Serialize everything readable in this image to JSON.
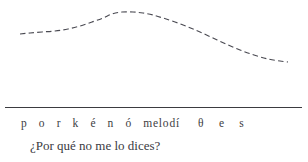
{
  "figure": {
    "name": "intonation-contour-figure",
    "background_color": "#ffffff",
    "ink_color": "#3d3d42",
    "contour_color": "#4a4a52"
  },
  "transcription": {
    "full": "p o r k é n ó  m e l o d í   θ   e   s",
    "segments": [
      {
        "text": "p o r k é n ó ",
        "style": "wide"
      },
      {
        "text": "melodí",
        "style": "tight"
      },
      {
        "text": "  θ e s",
        "style": "gap"
      }
    ],
    "phones": [
      "p",
      "o",
      "r",
      "k",
      "é",
      "n",
      "ó",
      "m",
      "e",
      "l",
      "o",
      "d",
      "í",
      "θ",
      "e",
      "s"
    ]
  },
  "gloss": {
    "text": "¿Por qué no me lo dices?",
    "language": "Spanish"
  },
  "baseline": {
    "label": "baseline-rule",
    "x_start": 5,
    "x_end": 302,
    "y": 107
  },
  "chart_data": {
    "type": "line",
    "title": "",
    "subtitle": "",
    "xlabel": "",
    "ylabel": "",
    "grid": false,
    "legend": null,
    "series": [
      {
        "name": "pitch-contour",
        "style": "dashed",
        "color": "#4a4a52",
        "x": [
          20,
          30,
          42,
          55,
          68,
          80,
          92,
          103,
          112,
          122,
          133,
          143,
          153,
          163,
          175,
          188,
          200,
          213,
          226,
          240,
          254,
          268,
          280,
          288
        ],
        "y": [
          34,
          33,
          32,
          31,
          29,
          26,
          22,
          18,
          14,
          12,
          12,
          13,
          15,
          18,
          22,
          27,
          32,
          38,
          44,
          50,
          55,
          59,
          61,
          62
        ]
      }
    ],
    "xlim": [
      0,
      308
    ],
    "ylim_inverted": true,
    "ylim": [
      0,
      100
    ],
    "annotations": [
      {
        "text": "rise to peak",
        "x_range": [
          20,
          125
        ]
      },
      {
        "text": "fall to low",
        "x_range": [
          125,
          288
        ]
      }
    ]
  }
}
